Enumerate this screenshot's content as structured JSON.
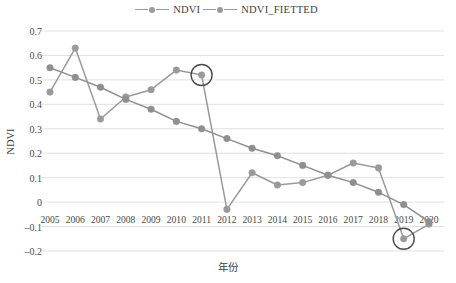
{
  "legend": {
    "position": "top-center",
    "entries": [
      {
        "label": "NDVI",
        "marker": "circle-line-marker",
        "color": "#9a9a9a"
      },
      {
        "label": "NDVI_FIETTED",
        "marker": "circle-line-marker",
        "color": "#9a9a9a"
      }
    ]
  },
  "axes": {
    "ylabel": "NDVI",
    "xlabel": "年份",
    "yticks": [
      "0.7",
      "0.6",
      "0.5",
      "0.4",
      "0.3",
      "0.2",
      "0.1",
      "0",
      "-0.1",
      "-0.2"
    ],
    "ytick_values": [
      0.7,
      0.6,
      0.5,
      0.4,
      0.3,
      0.2,
      0.1,
      0,
      -0.1,
      -0.2
    ]
  },
  "annotations": [
    {
      "name": "highlight-circle-2011",
      "x": 2011,
      "y": 0.52,
      "shape": "circle-outline"
    },
    {
      "name": "highlight-circle-2019",
      "x": 2019,
      "y": -0.15,
      "shape": "circle-outline"
    }
  ],
  "chart_data": {
    "type": "line",
    "title": "",
    "xlabel": "年份",
    "ylabel": "NDVI",
    "xlim": [
      2005,
      2020
    ],
    "ylim": [
      -0.2,
      0.7
    ],
    "grid": true,
    "legend_position": "top-center",
    "categories": [
      2005,
      2006,
      2007,
      2008,
      2009,
      2010,
      2011,
      2012,
      2013,
      2014,
      2015,
      2016,
      2017,
      2018,
      2019,
      2020
    ],
    "series": [
      {
        "name": "NDVI",
        "color": "#9a9a9a",
        "values": [
          0.45,
          0.63,
          0.34,
          0.43,
          0.46,
          0.54,
          0.52,
          -0.03,
          0.12,
          0.07,
          0.08,
          0.11,
          0.16,
          0.14,
          -0.15,
          -0.09
        ]
      },
      {
        "name": "NDVI_FIETTED",
        "color": "#8f8f8f",
        "values": [
          0.55,
          0.51,
          0.47,
          0.42,
          0.38,
          0.33,
          0.3,
          0.26,
          0.22,
          0.19,
          0.15,
          0.11,
          0.08,
          0.04,
          -0.01,
          -0.08
        ]
      }
    ]
  }
}
